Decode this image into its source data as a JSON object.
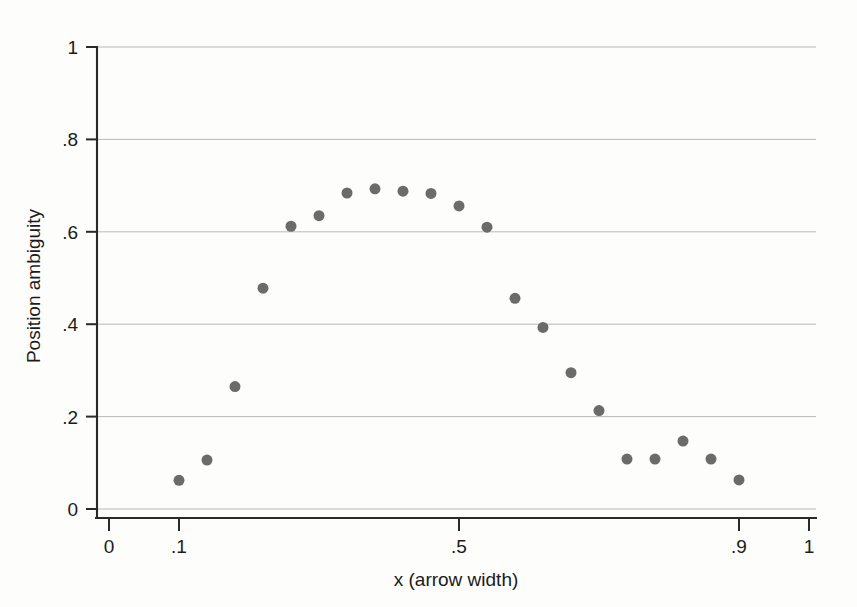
{
  "chart_data": {
    "type": "scatter",
    "title": "",
    "subtitle": "",
    "xlabel": "x (arrow width)",
    "ylabel": "Position ambiguity",
    "xlim": [
      0,
      1
    ],
    "ylim": [
      0,
      1
    ],
    "grid": true,
    "grid_axis": "y",
    "legend": null,
    "legend_position": "none",
    "marker_color": "#6b6b6b",
    "marker_size_px": 11,
    "xticks": [
      0,
      0.1,
      0.5,
      0.9,
      1
    ],
    "xtick_labels": [
      "0",
      ".1",
      ".5",
      ".9",
      "1"
    ],
    "yticks": [
      0,
      0.2,
      0.4,
      0.6,
      0.8,
      1
    ],
    "ytick_labels": [
      "0",
      ".2",
      ".4",
      ".6",
      ".8",
      "1"
    ],
    "series": [
      {
        "name": "Position ambiguity",
        "x": [
          0.1,
          0.14,
          0.18,
          0.22,
          0.26,
          0.3,
          0.34,
          0.38,
          0.42,
          0.46,
          0.5,
          0.54,
          0.58,
          0.62,
          0.66,
          0.7,
          0.74,
          0.78,
          0.82,
          0.86,
          0.9
        ],
        "y": [
          0.062,
          0.106,
          0.265,
          0.478,
          0.612,
          0.635,
          0.684,
          0.693,
          0.688,
          0.683,
          0.656,
          0.61,
          0.456,
          0.393,
          0.295,
          0.213,
          0.108,
          0.108,
          0.147,
          0.108,
          0.063
        ]
      }
    ],
    "points": [
      {
        "x": 0.1,
        "y": 0.062
      },
      {
        "x": 0.14,
        "y": 0.106
      },
      {
        "x": 0.18,
        "y": 0.265
      },
      {
        "x": 0.22,
        "y": 0.478
      },
      {
        "x": 0.26,
        "y": 0.612
      },
      {
        "x": 0.3,
        "y": 0.635
      },
      {
        "x": 0.34,
        "y": 0.684
      },
      {
        "x": 0.38,
        "y": 0.693
      },
      {
        "x": 0.42,
        "y": 0.688
      },
      {
        "x": 0.46,
        "y": 0.683
      },
      {
        "x": 0.5,
        "y": 0.656
      },
      {
        "x": 0.54,
        "y": 0.61
      },
      {
        "x": 0.58,
        "y": 0.456
      },
      {
        "x": 0.62,
        "y": 0.393
      },
      {
        "x": 0.66,
        "y": 0.295
      },
      {
        "x": 0.7,
        "y": 0.213
      },
      {
        "x": 0.74,
        "y": 0.108
      },
      {
        "x": 0.78,
        "y": 0.108
      },
      {
        "x": 0.82,
        "y": 0.147
      },
      {
        "x": 0.86,
        "y": 0.108
      },
      {
        "x": 0.9,
        "y": 0.063
      }
    ]
  },
  "axes": {
    "x_title": "x (arrow width)",
    "y_title": "Position ambiguity"
  },
  "colors": {
    "marker": "#6b6b6b",
    "gridline": "#b9b9b9",
    "axis": "#2a2a2a",
    "background": "#fdfdfc",
    "text": "#1b1b1b"
  }
}
